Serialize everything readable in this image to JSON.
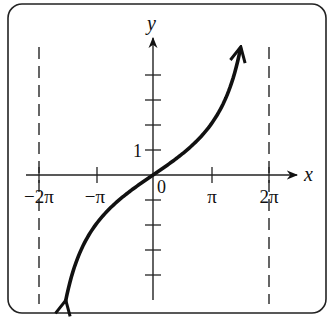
{
  "figure": {
    "type": "function-graph",
    "function": "y = 2 tan(x/4)",
    "frame": {
      "rounded": true,
      "stroke": "#222222"
    },
    "axes": {
      "x_label": "x",
      "y_label": "y",
      "origin_label": "0",
      "x_ticks": [
        {
          "value": "-2π",
          "label": "−2π"
        },
        {
          "value": "-π",
          "label": "−π"
        },
        {
          "value": "π",
          "label": "π"
        },
        {
          "value": "2π",
          "label": "2π"
        }
      ],
      "y_ticks": [
        -4,
        -3,
        -2,
        -1,
        1,
        2,
        3,
        4
      ],
      "y_tick_labels": [
        {
          "value": 1,
          "label": "1"
        }
      ]
    },
    "asymptotes": [
      {
        "x": "-2π",
        "style": "dashed"
      },
      {
        "x": "2π",
        "style": "dashed"
      }
    ],
    "curve": {
      "color": "#111111",
      "arrows_both_ends": true
    }
  }
}
